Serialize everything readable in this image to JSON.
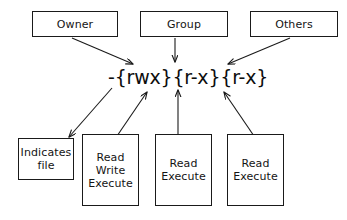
{
  "diagram": {
    "stroke_color": "#1a1a1a",
    "text_color": "#141414",
    "background_color": "#ffffff",
    "permission_string": "-{rwx}{r-x}{r-x}",
    "top_boxes": [
      {
        "label": "Owner"
      },
      {
        "label": "Group"
      },
      {
        "label": "Others"
      }
    ],
    "bottom_boxes": [
      {
        "lines": [
          "Indicates",
          "file"
        ]
      },
      {
        "lines": [
          "Read",
          "Write",
          "Execute"
        ]
      },
      {
        "lines": [
          "Read",
          "Execute"
        ]
      },
      {
        "lines": [
          "Read",
          "Execute"
        ]
      }
    ],
    "arrows": [
      {
        "name": "owner-to-permission",
        "from": "Owner",
        "to": "permission-string"
      },
      {
        "name": "group-to-permission",
        "from": "Group",
        "to": "permission-string"
      },
      {
        "name": "others-to-permission",
        "from": "Others",
        "to": "permission-string"
      },
      {
        "name": "permission-to-indicates-file",
        "from": "permission-string",
        "to": "Indicates file"
      },
      {
        "name": "read-write-execute-to-permission",
        "from": "Read Write Execute",
        "to": "permission-string"
      },
      {
        "name": "read-execute-group-to-permission",
        "from": "Read Execute",
        "to": "permission-string"
      },
      {
        "name": "read-execute-others-to-permission",
        "from": "Read Execute",
        "to": "permission-string"
      }
    ]
  }
}
